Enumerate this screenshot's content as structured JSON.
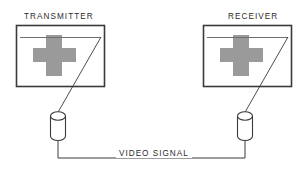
{
  "diagram": {
    "colors": {
      "background": "#ffffff",
      "stroke": "#3a3a3a",
      "cross_fill": "#9a9a9a",
      "text": "#2b2b2b",
      "thin_stroke": "#6f6f6f"
    },
    "devices": [
      {
        "id": "transmitter",
        "label": "TRANSMITTER",
        "screen_symbol": "cross-symbol",
        "sensor_symbol": "cylinder-probe"
      },
      {
        "id": "receiver",
        "label": "RECEIVER",
        "screen_symbol": "cross-symbol",
        "sensor_symbol": "cylinder-probe"
      }
    ],
    "connection": {
      "label": "VIDEO SIGNAL"
    }
  }
}
